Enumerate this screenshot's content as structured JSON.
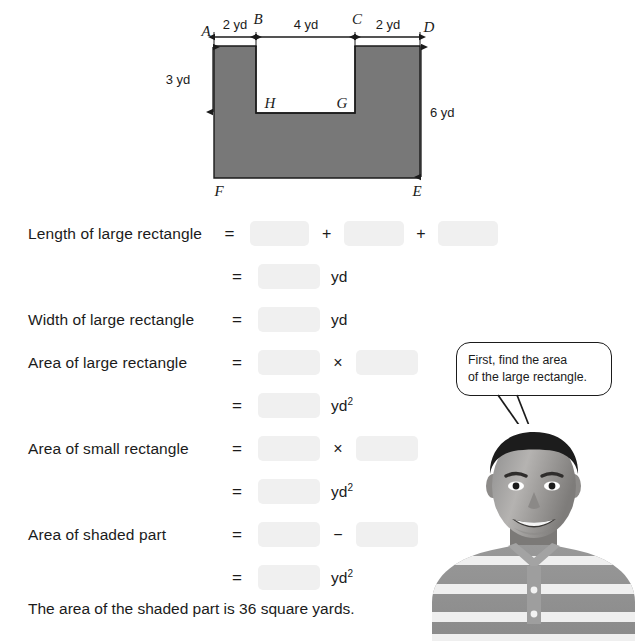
{
  "figure": {
    "vertex_labels": {
      "A": "A",
      "B": "B",
      "C": "C",
      "D": "D",
      "E": "E",
      "F": "F",
      "G": "G",
      "H": "H"
    },
    "dimensions": {
      "top_left": "2 yd",
      "top_middle": "4 yd",
      "top_right": "2 yd",
      "left_side": "3 yd",
      "right_side": "6 yd"
    },
    "shaded_color": "#787878",
    "outline_color": "#1b1b1b"
  },
  "worksheet": {
    "rows": [
      {
        "label": "Length of large rectangle",
        "equals": "=",
        "blanks": 3,
        "op1": "+",
        "op2": "+",
        "unit": ""
      },
      {
        "label": "",
        "equals": "=",
        "blanks": 1,
        "unit": "yd"
      },
      {
        "label": "Width of large rectangle",
        "equals": "=",
        "blanks": 1,
        "unit": "yd"
      },
      {
        "label": "Area of large rectangle",
        "equals": "=",
        "blanks": 2,
        "op1": "×",
        "unit": ""
      },
      {
        "label": "",
        "equals": "=",
        "blanks": 1,
        "unit": "yd",
        "exp": "2"
      },
      {
        "label": "Area of small rectangle",
        "equals": "=",
        "blanks": 2,
        "op1": "×",
        "unit": ""
      },
      {
        "label": "",
        "equals": "=",
        "blanks": 1,
        "unit": "yd",
        "exp": "2"
      },
      {
        "label": "Area of shaded part",
        "equals": "=",
        "blanks": 2,
        "op1": "−",
        "unit": ""
      },
      {
        "label": "",
        "equals": "=",
        "blanks": 1,
        "unit": "yd",
        "exp": "2"
      }
    ],
    "row_labels": {
      "length_large": "Length of large rectangle",
      "width_large": "Width of large rectangle",
      "area_large": "Area of large rectangle",
      "area_small": "Area of small rectangle",
      "area_shaded": "Area of shaded part"
    },
    "operators": {
      "equals": "=",
      "plus": "+",
      "times": "×",
      "minus": "−"
    },
    "units": {
      "yd": "yd",
      "yd_squared": "yd",
      "exponent": "2"
    }
  },
  "conclusion": {
    "text": "The area of the shaded part is 36 square yards."
  },
  "speech_bubble": {
    "line1": "First, find the area",
    "line2": "of the large rectangle."
  },
  "photo": {
    "description": "student-photo"
  }
}
